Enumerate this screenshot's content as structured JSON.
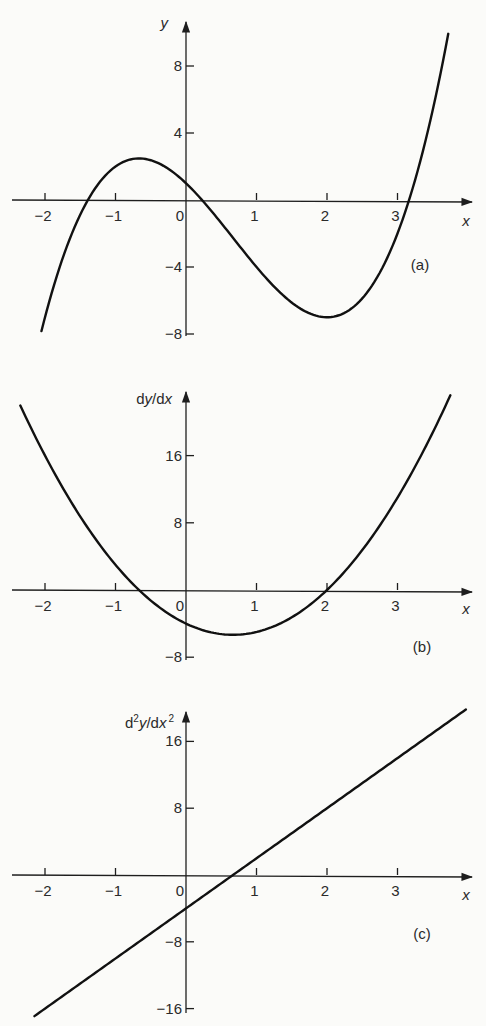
{
  "chart_data": [
    {
      "id": "a",
      "type": "line",
      "panel_label": "(a)",
      "title": "",
      "xlabel": "x",
      "ylabel": "y",
      "function": "y = x^3 - 2x^2 - 4x + 1",
      "coefficients": [
        1,
        -2,
        -4,
        1
      ],
      "xrange": [
        -2.05,
        3.72
      ],
      "xlim": [
        -2.5,
        4.0
      ],
      "ylim": [
        -8,
        10
      ],
      "x_ticks": [
        -2,
        -1,
        0,
        1,
        2,
        3
      ],
      "x_tick_labels": [
        "−2",
        "−1",
        "0",
        "1",
        "2",
        "3"
      ],
      "y_ticks": [
        8,
        4,
        -4,
        -8
      ],
      "y_tick_labels": [
        "8",
        "4",
        "−4",
        "−8"
      ],
      "key_points": [
        {
          "x": -0.67,
          "y": 2.48,
          "note": "local maximum"
        },
        {
          "x": 2,
          "y": -7,
          "note": "local minimum"
        },
        {
          "x": 0,
          "y": 1,
          "note": "y-intercept"
        }
      ],
      "grid": false,
      "legend": "none"
    },
    {
      "id": "b",
      "type": "line",
      "panel_label": "(b)",
      "title": "",
      "xlabel": "x",
      "ylabel": "dy/dx",
      "function": "dy/dx = 3x^2 - 4x - 4",
      "coefficients": [
        0,
        3,
        -4,
        -4
      ],
      "xrange": [
        -2.35,
        3.75
      ],
      "xlim": [
        -2.5,
        4.0
      ],
      "ylim": [
        -8,
        24
      ],
      "x_ticks": [
        -2,
        -1,
        0,
        1,
        2,
        3
      ],
      "x_tick_labels": [
        "−2",
        "−1",
        "0",
        "1",
        "2",
        "3"
      ],
      "y_ticks": [
        16,
        8,
        -8
      ],
      "y_tick_labels": [
        "16",
        "8",
        "−8"
      ],
      "key_points": [
        {
          "x": -0.67,
          "y": 0,
          "note": "root"
        },
        {
          "x": 2,
          "y": 0,
          "note": "root"
        },
        {
          "x": 0.67,
          "y": -5.33,
          "note": "minimum"
        }
      ],
      "grid": false,
      "legend": "none"
    },
    {
      "id": "c",
      "type": "line",
      "panel_label": "(c)",
      "title": "",
      "xlabel": "x",
      "ylabel_parts": [
        "d",
        "2",
        "y/dx",
        "2"
      ],
      "ylabel": "d²y/dx²",
      "function": "d2y/dx2 = 6x - 4",
      "coefficients": [
        0,
        0,
        6,
        -4
      ],
      "xrange": [
        -2.15,
        3.97
      ],
      "xlim": [
        -2.5,
        4.0
      ],
      "ylim": [
        -16,
        20
      ],
      "x_ticks": [
        -2,
        -1,
        0,
        1,
        2,
        3
      ],
      "x_tick_labels": [
        "−2",
        "−1",
        "0",
        "1",
        "2",
        "3"
      ],
      "y_ticks": [
        16,
        8,
        -8,
        -16
      ],
      "y_tick_labels": [
        "16",
        "8",
        "−8",
        "−16"
      ],
      "key_points": [
        {
          "x": 0.67,
          "y": 0,
          "note": "root"
        },
        {
          "x": 0,
          "y": -4,
          "note": "y-intercept"
        }
      ],
      "grid": false,
      "legend": "none"
    }
  ]
}
